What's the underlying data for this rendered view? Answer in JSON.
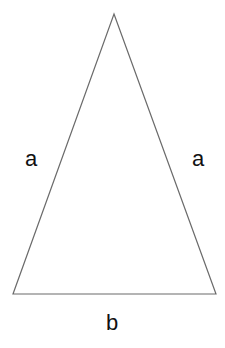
{
  "figure": {
    "kind": "geometry-diagram",
    "shape_name": "isosceles-triangle",
    "canvas": {
      "width": 225,
      "height": 348,
      "background_color": "#ffffff"
    },
    "stroke": {
      "color": "#6b6b6b",
      "width": 1.2
    },
    "text_color": "#111111",
    "font_size_px": 22,
    "vertices": {
      "apex": {
        "x": 114,
        "y": 14
      },
      "bottom_left": {
        "x": 13,
        "y": 294
      },
      "bottom_right": {
        "x": 216,
        "y": 294
      }
    },
    "polygon_points": "114,14 216,294 13,294",
    "labels": [
      {
        "id": "left-side",
        "text": "a",
        "side": "left-leg",
        "x": 25,
        "y": 148
      },
      {
        "id": "right-side",
        "text": "a",
        "side": "right-leg",
        "x": 192,
        "y": 148
      },
      {
        "id": "base",
        "text": "b",
        "side": "base",
        "x": 106,
        "y": 312
      }
    ]
  }
}
